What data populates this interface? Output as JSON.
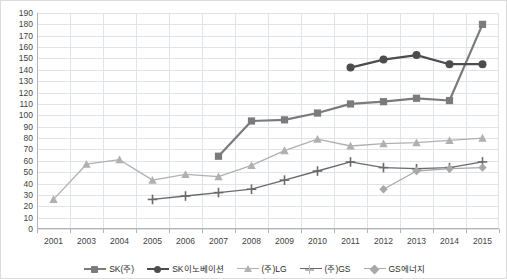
{
  "chart_data": {
    "type": "line",
    "title": "",
    "xlabel": "",
    "ylabel": "",
    "ylim": [
      0,
      190
    ],
    "ytick_step": 10,
    "grid": true,
    "legend_position": "bottom",
    "categories": [
      "2001",
      "2003",
      "2004",
      "2005",
      "2006",
      "2007",
      "2008",
      "2009",
      "2010",
      "2011",
      "2012",
      "2013",
      "2014",
      "2015"
    ],
    "ytick_labels": [
      "190",
      "180",
      "170",
      "160",
      "150",
      "140",
      "130",
      "120",
      "110",
      "100",
      "90",
      "80",
      "70",
      "60",
      "50",
      "40",
      "30",
      "20",
      "10",
      "0"
    ],
    "series": [
      {
        "name": "SK(주)",
        "marker": "square",
        "color": "#7b7b7b",
        "values": [
          null,
          null,
          null,
          null,
          null,
          64,
          95,
          96,
          102,
          110,
          112,
          115,
          113,
          180
        ]
      },
      {
        "name": "SK이노베이션",
        "marker": "circle",
        "color": "#4d4d4d",
        "values": [
          null,
          null,
          null,
          null,
          null,
          null,
          null,
          null,
          null,
          142,
          149,
          153,
          145,
          145
        ]
      },
      {
        "name": "(주)LG",
        "marker": "triangle",
        "color": "#b0b0b0",
        "values": [
          26,
          57,
          61,
          43,
          48,
          46,
          56,
          69,
          79,
          73,
          75,
          76,
          78,
          80
        ]
      },
      {
        "name": "(주)GS",
        "marker": "plus",
        "color": "#6a6a6a",
        "values": [
          null,
          null,
          null,
          26,
          29,
          32,
          35,
          43,
          51,
          59,
          54,
          53,
          54,
          59
        ]
      },
      {
        "name": "GS에너지",
        "marker": "diamond",
        "color": "#a8a8a8",
        "values": [
          null,
          null,
          null,
          null,
          null,
          null,
          null,
          null,
          null,
          null,
          35,
          51,
          53,
          54
        ]
      }
    ]
  },
  "legend": {
    "items": [
      {
        "label": "SK(주)"
      },
      {
        "label": "SK이노베이션"
      },
      {
        "label": "(주)LG"
      },
      {
        "label": "(주)GS"
      },
      {
        "label": "GS에너지"
      }
    ]
  }
}
